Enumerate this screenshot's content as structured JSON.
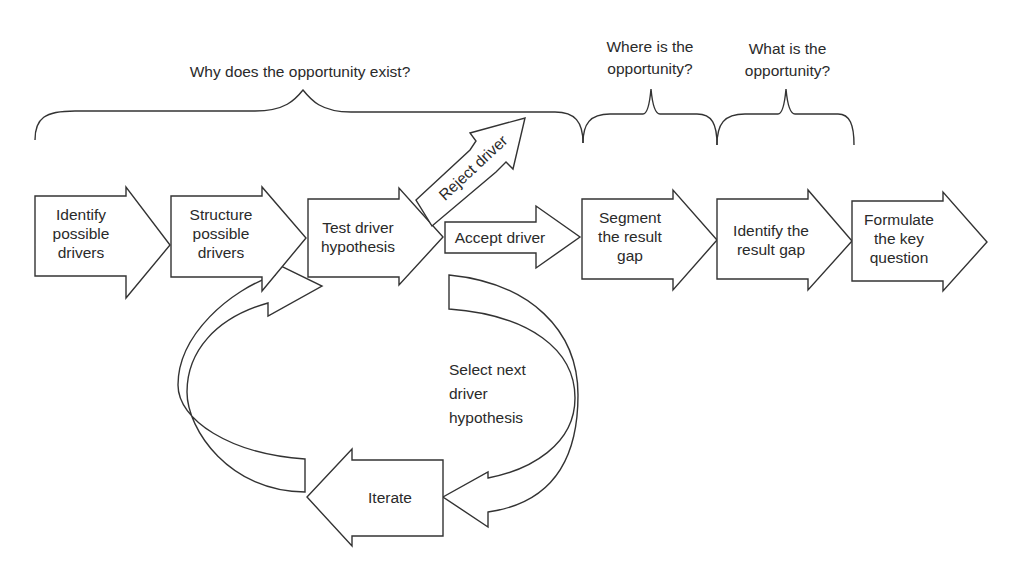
{
  "questions": {
    "why": "Why does the opportunity exist?",
    "where": "Where is the\nopportunity?",
    "what": "What is the\nopportunity?"
  },
  "steps": [
    {
      "id": "identify-possible-drivers",
      "label": "Identify\npossible\ndrivers"
    },
    {
      "id": "structure-possible-drivers",
      "label": "Structure\npossible\ndrivers"
    },
    {
      "id": "test-driver-hypothesis",
      "label": "Test driver\nhypothesis"
    },
    {
      "id": "accept-driver",
      "label": "Accept driver"
    },
    {
      "id": "segment-result-gap",
      "label": "Segment\nthe result\ngap"
    },
    {
      "id": "identify-result-gap",
      "label": "Identify the\nresult gap"
    },
    {
      "id": "formulate-key-question",
      "label": "Formulate\nthe key\nquestion"
    }
  ],
  "branch": {
    "reject": "Reject driver"
  },
  "loop": {
    "select_next": "Select next\ndriver\nhypothesis",
    "iterate": "Iterate"
  },
  "colors": {
    "stroke": "#333333",
    "fill": "#ffffff",
    "text": "#2a2a2a"
  }
}
